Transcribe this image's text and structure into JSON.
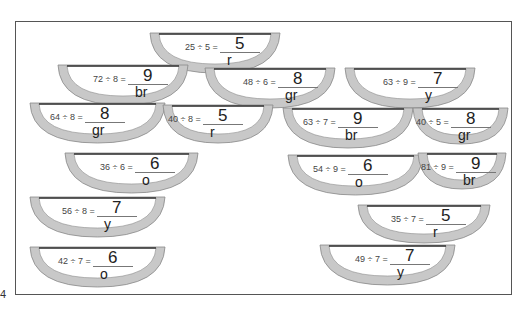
{
  "worksheet": {
    "page_number": "4",
    "band_color": "#c8c8c8",
    "rim_color": "#333333",
    "problems": [
      {
        "question": "25 ÷ 5 =",
        "answer": "5",
        "code": "r"
      },
      {
        "question": "72 ÷ 8 =",
        "answer": "9",
        "code": "br"
      },
      {
        "question": "48 ÷ 6 =",
        "answer": "8",
        "code": "gr"
      },
      {
        "question": "63 ÷ 9 =",
        "answer": "7",
        "code": "y"
      },
      {
        "question": "64 ÷ 8 =",
        "answer": "8",
        "code": "gr"
      },
      {
        "question": "40 ÷ 8 =",
        "answer": "5",
        "code": "r"
      },
      {
        "question": "63 ÷ 7 =",
        "answer": "9",
        "code": "br"
      },
      {
        "question": "40 ÷ 5 =",
        "answer": "8",
        "code": "gr"
      },
      {
        "question": "36 ÷ 6 =",
        "answer": "6",
        "code": "o"
      },
      {
        "question": "54 ÷ 9 =",
        "answer": "6",
        "code": "o"
      },
      {
        "question": "81 ÷ 9 =",
        "answer": "9",
        "code": "br"
      },
      {
        "question": "56 ÷ 8 =",
        "answer": "7",
        "code": "y"
      },
      {
        "question": "35 ÷ 7 =",
        "answer": "5",
        "code": "r"
      },
      {
        "question": "42 ÷ 7 =",
        "answer": "6",
        "code": "o"
      },
      {
        "question": "49 ÷ 7 =",
        "answer": "7",
        "code": "y"
      }
    ]
  }
}
